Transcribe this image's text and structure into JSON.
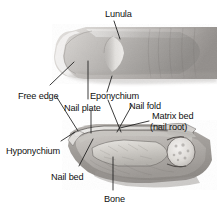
{
  "figure": {
    "width": 217,
    "height": 214,
    "background_color": "#ffffff",
    "line_color": "#1a1a1a",
    "text_color": "#111111"
  },
  "labels": [
    {
      "id": "lunula",
      "text": "Lunula",
      "x": 105,
      "y": 9,
      "anchor": "start"
    },
    {
      "id": "free_edge",
      "text": "Free edge",
      "x": 18,
      "y": 91,
      "anchor": "start"
    },
    {
      "id": "eponychium",
      "text": "Eponychium",
      "x": 90,
      "y": 91,
      "anchor": "start"
    },
    {
      "id": "nail_plate",
      "text": "Nail plate",
      "x": 64,
      "y": 103,
      "anchor": "start"
    },
    {
      "id": "nail_fold",
      "text": "Nail fold",
      "x": 129,
      "y": 101,
      "anchor": "start"
    },
    {
      "id": "matrix_bed",
      "text": "Matrix bed",
      "x": 152,
      "y": 111,
      "anchor": "start"
    },
    {
      "id": "nail_root",
      "text": "(nail root)",
      "x": 150,
      "y": 122,
      "anchor": "start"
    },
    {
      "id": "hyponychium",
      "text": "Hyponychium",
      "x": 6,
      "y": 146,
      "anchor": "start"
    },
    {
      "id": "nail_bed",
      "text": "Nail bed",
      "x": 51,
      "y": 172,
      "anchor": "start"
    },
    {
      "id": "bone",
      "text": "Bone",
      "x": 104,
      "y": 194,
      "anchor": "start"
    }
  ],
  "leader_lines": [
    {
      "id": "lunula-leader",
      "from_label": "lunula",
      "points": "114,21 119,38"
    },
    {
      "id": "free-edge-leader-a",
      "from_label": "free_edge",
      "points": "50,86 73,63"
    },
    {
      "id": "free-edge-leader-b",
      "from_label": "free_edge",
      "points": "55,96 77,130"
    },
    {
      "id": "eponychium-leader",
      "from_label": "eponychium",
      "points": "106,93 111,78"
    },
    {
      "id": "eponychium-leader2",
      "from_label": "eponychium",
      "points": "106,100 112,133"
    },
    {
      "id": "nail-plate-leader",
      "from_label": "nail_plate",
      "points": "88,100 88,62"
    },
    {
      "id": "nail-plate-leader2",
      "from_label": "nail_plate",
      "points": "91,110 90,132"
    },
    {
      "id": "nail-fold-leader",
      "from_label": "nail_fold",
      "points": "131,106 117,133"
    },
    {
      "id": "matrix-leader",
      "from_label": "matrix_bed",
      "points": "148,121 120,128"
    },
    {
      "id": "hyponychium-leader",
      "from_label": "hyponychium",
      "points": "60,142 73,133"
    },
    {
      "id": "nail-bed-leader",
      "from_label": "nail_bed",
      "points": "78,167 92,140"
    },
    {
      "id": "bone-leader",
      "from_label": "bone",
      "points": "113,191 113,158"
    }
  ],
  "illustrations": [
    {
      "id": "dorsal-fingertip",
      "name": "Dorsal view of fingertip with nail",
      "caption_parts": [
        "nail plate",
        "lunula",
        "eponychium",
        "free edge"
      ]
    },
    {
      "id": "sagittal-section",
      "name": "Sagittal cross-section of distal finger",
      "caption_parts": [
        "nail plate",
        "nail bed",
        "matrix",
        "distal phalanx bone",
        "joint"
      ]
    }
  ]
}
